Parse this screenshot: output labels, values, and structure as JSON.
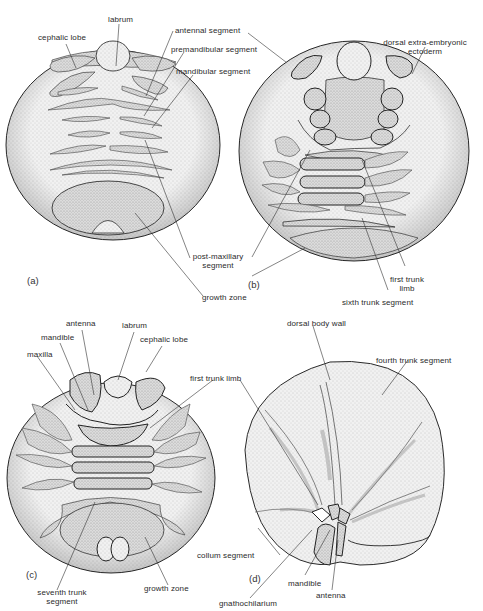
{
  "figure": {
    "panels": [
      {
        "id": "a",
        "tag": "(a)",
        "labels": {
          "labrum": "labrum",
          "cephalic_lobe": "cephalic lobe",
          "antennal_segment": "antennal segment",
          "premandibular_segment": "premandibular segment",
          "mandibular_segment": "mandibular segment",
          "post_maxillary_1": "post-maxillary",
          "post_maxillary_2": "segment",
          "growth_zone": "growth zone"
        }
      },
      {
        "id": "b",
        "tag": "(b)",
        "labels": {
          "dorsal_1": "dorsal extra-embryonic",
          "dorsal_2": "ectoderm",
          "first_trunk_limb_1": "first trunk",
          "first_trunk_limb_2": "limb",
          "sixth_trunk_segment": "sixth trunk segment"
        }
      },
      {
        "id": "c",
        "tag": "(c)",
        "labels": {
          "antenna": "antenna",
          "labrum": "labrum",
          "mandible": "mandible",
          "cephalic_lobe": "cephalic lobe",
          "maxilla": "maxilla",
          "first_trunk_limb": "first trunk limb",
          "seventh_trunk_1": "seventh trunk",
          "seventh_trunk_2": "segment",
          "growth_zone": "growth zone"
        }
      },
      {
        "id": "d",
        "tag": "(d)",
        "labels": {
          "dorsal_body_wall": "dorsal body wall",
          "fourth_trunk_segment": "fourth trunk segment",
          "collum_segment": "collum segment",
          "mandible": "mandible",
          "antenna": "antenna",
          "gnathochilarium": "gnathochilarium"
        }
      }
    ],
    "colors": {
      "outline": "#2a2a2a",
      "embryo_fill": "#ececec",
      "tissue_fill": "#d6d6d6",
      "leader_line": "#333333"
    }
  }
}
